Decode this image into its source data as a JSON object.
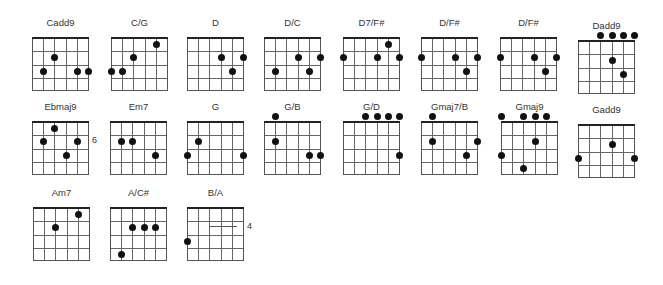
{
  "chord_sheet": {
    "strings": 6,
    "frets": 4,
    "chords": [
      {
        "name": "Cadd9",
        "x": 32,
        "y": 17,
        "open_dots": [],
        "dots": [
          {
            "s": 3,
            "f": 2
          },
          {
            "s": 2,
            "f": 3
          },
          {
            "s": 5,
            "f": 3
          },
          {
            "s": 6,
            "f": 3
          }
        ]
      },
      {
        "name": "C/G",
        "x": 111,
        "y": 17,
        "open_dots": [],
        "dots": [
          {
            "s": 5,
            "f": 1
          },
          {
            "s": 3,
            "f": 2
          },
          {
            "s": 1,
            "f": 3
          },
          {
            "s": 2,
            "f": 3
          }
        ]
      },
      {
        "name": "D",
        "x": 187,
        "y": 17,
        "open_dots": [],
        "dots": [
          {
            "s": 4,
            "f": 2
          },
          {
            "s": 6,
            "f": 2
          },
          {
            "s": 5,
            "f": 3
          }
        ]
      },
      {
        "name": "D/C",
        "x": 264,
        "y": 17,
        "open_dots": [],
        "dots": [
          {
            "s": 4,
            "f": 2
          },
          {
            "s": 6,
            "f": 2
          },
          {
            "s": 2,
            "f": 3
          },
          {
            "s": 5,
            "f": 3
          }
        ]
      },
      {
        "name": "D7/F#",
        "x": 343,
        "y": 17,
        "open_dots": [],
        "dots": [
          {
            "s": 5,
            "f": 1
          },
          {
            "s": 1,
            "f": 2
          },
          {
            "s": 4,
            "f": 2
          },
          {
            "s": 6,
            "f": 2
          }
        ]
      },
      {
        "name": "D/F#",
        "x": 421,
        "y": 17,
        "open_dots": [],
        "dots": [
          {
            "s": 1,
            "f": 2
          },
          {
            "s": 4,
            "f": 2
          },
          {
            "s": 6,
            "f": 2
          },
          {
            "s": 5,
            "f": 3
          }
        ]
      },
      {
        "name": "D/F#",
        "x": 500,
        "y": 17,
        "open_dots": [],
        "dots": [
          {
            "s": 1,
            "f": 2
          },
          {
            "s": 4,
            "f": 2
          },
          {
            "s": 6,
            "f": 2
          },
          {
            "s": 5,
            "f": 3
          }
        ]
      },
      {
        "name": "Dadd9",
        "x": 578,
        "y": 20,
        "open_dots": [
          3,
          4,
          5,
          6
        ],
        "dots": [
          {
            "s": 4,
            "f": 2
          },
          {
            "s": 5,
            "f": 3
          }
        ]
      },
      {
        "name": "Ebmaj9",
        "x": 32,
        "y": 101,
        "open_dots": [],
        "dots": [
          {
            "s": 3,
            "f": 1
          },
          {
            "s": 2,
            "f": 2
          },
          {
            "s": 5,
            "f": 2
          },
          {
            "s": 4,
            "f": 3
          }
        ],
        "fret_label": "6",
        "fret_label_row": 2
      },
      {
        "name": "Em7",
        "x": 110,
        "y": 101,
        "open_dots": [],
        "dots": [
          {
            "s": 2,
            "f": 2
          },
          {
            "s": 3,
            "f": 2
          },
          {
            "s": 5,
            "f": 3
          }
        ]
      },
      {
        "name": "G",
        "x": 187,
        "y": 101,
        "open_dots": [],
        "dots": [
          {
            "s": 2,
            "f": 2
          },
          {
            "s": 1,
            "f": 3
          },
          {
            "s": 6,
            "f": 3
          }
        ]
      },
      {
        "name": "G/B",
        "x": 264,
        "y": 101,
        "open_dots": [
          2
        ],
        "dots": [
          {
            "s": 2,
            "f": 2
          },
          {
            "s": 5,
            "f": 3
          },
          {
            "s": 6,
            "f": 3
          }
        ]
      },
      {
        "name": "G/D",
        "x": 343,
        "y": 101,
        "open_dots": [
          3,
          4,
          5,
          6
        ],
        "dots": [
          {
            "s": 6,
            "f": 3
          }
        ]
      },
      {
        "name": "Gmaj7/B",
        "x": 421,
        "y": 101,
        "open_dots": [
          2
        ],
        "dots": [
          {
            "s": 2,
            "f": 2
          },
          {
            "s": 6,
            "f": 2
          },
          {
            "s": 5,
            "f": 3
          }
        ]
      },
      {
        "name": "Gmaj9",
        "x": 501,
        "y": 101,
        "open_dots": [
          1,
          3,
          4,
          5
        ],
        "dots": [
          {
            "s": 4,
            "f": 2
          },
          {
            "s": 1,
            "f": 3
          },
          {
            "s": 3,
            "f": 4
          }
        ]
      },
      {
        "name": "Gadd9",
        "x": 578,
        "y": 104,
        "open_dots": [],
        "dots": [
          {
            "s": 4,
            "f": 2
          },
          {
            "s": 1,
            "f": 3
          },
          {
            "s": 6,
            "f": 3
          }
        ]
      },
      {
        "name": "Am7",
        "x": 33,
        "y": 187,
        "open_dots": [],
        "dots": [
          {
            "s": 5,
            "f": 1
          },
          {
            "s": 3,
            "f": 2
          }
        ]
      },
      {
        "name": "A/C#",
        "x": 110,
        "y": 187,
        "open_dots": [],
        "dots": [
          {
            "s": 3,
            "f": 2
          },
          {
            "s": 4,
            "f": 2
          },
          {
            "s": 5,
            "f": 2
          },
          {
            "s": 2,
            "f": 4
          }
        ]
      },
      {
        "name": "B/A",
        "x": 187,
        "y": 187,
        "open_dots": [],
        "dots": [
          {
            "s": 1,
            "f": 3
          }
        ],
        "barre": {
          "from": 3,
          "to": 6,
          "f": 2
        },
        "fret_label": "4",
        "fret_label_row": 2
      }
    ]
  }
}
